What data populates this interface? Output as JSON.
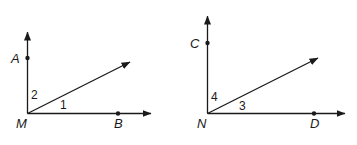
{
  "figure": {
    "background_color": "#ffffff",
    "stroke_color": "#1a1a1a",
    "diagrams": [
      {
        "id": "left",
        "vertex_label": "M",
        "vertical_point_label": "A",
        "horizontal_point_label": "B",
        "angle_labels": {
          "lower": "1",
          "upper": "2"
        }
      },
      {
        "id": "right",
        "vertex_label": "N",
        "vertical_point_label": "C",
        "horizontal_point_label": "D",
        "angle_labels": {
          "lower": "3",
          "upper": "4"
        }
      }
    ]
  }
}
